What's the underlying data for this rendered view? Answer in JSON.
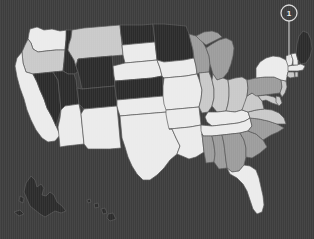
{
  "map": {
    "title": "United States choropleth map",
    "background_color": "#3d3d3d",
    "border_color": "#5a5a5a",
    "shade_scale": {
      "darkest": "#2b2b2b",
      "dark": "#7f7f7f",
      "medium": "#9c9c9c",
      "light": "#c9c9c9",
      "lightest": "#ebebeb"
    },
    "states": [
      {
        "code": "WA",
        "name": "Washington",
        "shade": "lightest",
        "color": "#ebebeb"
      },
      {
        "code": "OR",
        "name": "Oregon",
        "shade": "light",
        "color": "#c9c9c9"
      },
      {
        "code": "CA",
        "name": "California",
        "shade": "lightest",
        "color": "#ebebeb"
      },
      {
        "code": "ID",
        "name": "Idaho",
        "shade": "darkest",
        "color": "#2b2b2b"
      },
      {
        "code": "NV",
        "name": "Nevada",
        "shade": "darkest",
        "color": "#2b2b2b"
      },
      {
        "code": "UT",
        "name": "Utah",
        "shade": "darkest",
        "color": "#2b2b2b"
      },
      {
        "code": "AZ",
        "name": "Arizona",
        "shade": "lightest",
        "color": "#ebebeb"
      },
      {
        "code": "MT",
        "name": "Montana",
        "shade": "light",
        "color": "#c9c9c9"
      },
      {
        "code": "WY",
        "name": "Wyoming",
        "shade": "darkest",
        "color": "#2b2b2b"
      },
      {
        "code": "CO",
        "name": "Colorado",
        "shade": "darkest",
        "color": "#2b2b2b"
      },
      {
        "code": "NM",
        "name": "New Mexico",
        "shade": "lightest",
        "color": "#ebebeb"
      },
      {
        "code": "ND",
        "name": "North Dakota",
        "shade": "darkest",
        "color": "#2b2b2b"
      },
      {
        "code": "SD",
        "name": "South Dakota",
        "shade": "lightest",
        "color": "#ebebeb"
      },
      {
        "code": "NE",
        "name": "Nebraska",
        "shade": "lightest",
        "color": "#ebebeb"
      },
      {
        "code": "KS",
        "name": "Kansas",
        "shade": "darkest",
        "color": "#2b2b2b"
      },
      {
        "code": "OK",
        "name": "Oklahoma",
        "shade": "lightest",
        "color": "#ebebeb"
      },
      {
        "code": "TX",
        "name": "Texas",
        "shade": "lightest",
        "color": "#ebebeb"
      },
      {
        "code": "MN",
        "name": "Minnesota",
        "shade": "darkest",
        "color": "#2b2b2b"
      },
      {
        "code": "IA",
        "name": "Iowa",
        "shade": "lightest",
        "color": "#ebebeb"
      },
      {
        "code": "MO",
        "name": "Missouri",
        "shade": "lightest",
        "color": "#ebebeb"
      },
      {
        "code": "AR",
        "name": "Arkansas",
        "shade": "lightest",
        "color": "#ebebeb"
      },
      {
        "code": "LA",
        "name": "Louisiana",
        "shade": "lightest",
        "color": "#ebebeb"
      },
      {
        "code": "WI",
        "name": "Wisconsin",
        "shade": "medium",
        "color": "#9c9c9c"
      },
      {
        "code": "IL",
        "name": "Illinois",
        "shade": "light",
        "color": "#c9c9c9"
      },
      {
        "code": "MI",
        "name": "Michigan",
        "shade": "medium",
        "color": "#9c9c9c"
      },
      {
        "code": "IN",
        "name": "Indiana",
        "shade": "light",
        "color": "#c9c9c9"
      },
      {
        "code": "OH",
        "name": "Ohio",
        "shade": "light",
        "color": "#c9c9c9"
      },
      {
        "code": "KY",
        "name": "Kentucky",
        "shade": "lightest",
        "color": "#ebebeb"
      },
      {
        "code": "TN",
        "name": "Tennessee",
        "shade": "lightest",
        "color": "#ebebeb"
      },
      {
        "code": "MS",
        "name": "Mississippi",
        "shade": "medium",
        "color": "#9c9c9c"
      },
      {
        "code": "AL",
        "name": "Alabama",
        "shade": "medium",
        "color": "#9c9c9c"
      },
      {
        "code": "GA",
        "name": "Georgia",
        "shade": "medium",
        "color": "#9c9c9c"
      },
      {
        "code": "FL",
        "name": "Florida",
        "shade": "lightest",
        "color": "#ebebeb"
      },
      {
        "code": "SC",
        "name": "South Carolina",
        "shade": "medium",
        "color": "#9c9c9c"
      },
      {
        "code": "NC",
        "name": "North Carolina",
        "shade": "medium",
        "color": "#9c9c9c"
      },
      {
        "code": "VA",
        "name": "Virginia",
        "shade": "light",
        "color": "#c9c9c9"
      },
      {
        "code": "WV",
        "name": "West Virginia",
        "shade": "light",
        "color": "#c9c9c9"
      },
      {
        "code": "MD",
        "name": "Maryland",
        "shade": "light",
        "color": "#c9c9c9"
      },
      {
        "code": "DE",
        "name": "Delaware",
        "shade": "light",
        "color": "#c9c9c9"
      },
      {
        "code": "PA",
        "name": "Pennsylvania",
        "shade": "medium",
        "color": "#9c9c9c"
      },
      {
        "code": "NJ",
        "name": "New Jersey",
        "shade": "light",
        "color": "#c9c9c9"
      },
      {
        "code": "NY",
        "name": "New York",
        "shade": "lightest",
        "color": "#ebebeb"
      },
      {
        "code": "CT",
        "name": "Connecticut",
        "shade": "light",
        "color": "#c9c9c9"
      },
      {
        "code": "RI",
        "name": "Rhode Island",
        "shade": "light",
        "color": "#c9c9c9"
      },
      {
        "code": "MA",
        "name": "Massachusetts",
        "shade": "lightest",
        "color": "#ebebeb"
      },
      {
        "code": "VT",
        "name": "Vermont",
        "shade": "lightest",
        "color": "#ebebeb"
      },
      {
        "code": "NH",
        "name": "New Hampshire",
        "shade": "lightest",
        "color": "#ebebeb"
      },
      {
        "code": "ME",
        "name": "Maine",
        "shade": "darkest",
        "color": "#2b2b2b"
      },
      {
        "code": "AK",
        "name": "Alaska",
        "shade": "darkest",
        "color": "#2b2b2b"
      },
      {
        "code": "HI",
        "name": "Hawaii",
        "shade": "darkest",
        "color": "#2b2b2b"
      }
    ],
    "markers": [
      {
        "id": "marker-1",
        "label": "1",
        "target_state": "NH",
        "circle_x": 289,
        "circle_y": 13,
        "circle_r": 8,
        "stem_end_y": 60,
        "circle_color": "#d9d9d9",
        "label_color": "#ececec"
      }
    ]
  }
}
